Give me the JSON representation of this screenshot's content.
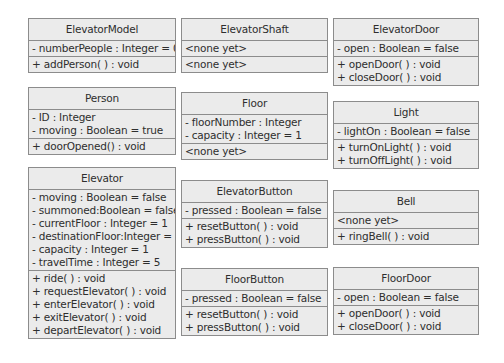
{
  "classes": {
    "elevatorModel": {
      "name": "ElevatorModel",
      "attributes": [
        "- numberPeople : Integer = 0"
      ],
      "operations": [
        "+ addPerson( ) : void"
      ]
    },
    "elevatorShaft": {
      "name": "ElevatorShaft",
      "attributes": [
        "<none yet>"
      ],
      "operations": [
        "<none yet>"
      ]
    },
    "elevatorDoor": {
      "name": "ElevatorDoor",
      "attributes": [
        "- open : Boolean = false"
      ],
      "operations": [
        "+ openDoor( ) : void",
        "+ closeDoor( ) : void"
      ]
    },
    "person": {
      "name": "Person",
      "attributes": [
        "- ID : Integer",
        "- moving : Boolean = true"
      ],
      "operations": [
        "+ doorOpened() : void"
      ]
    },
    "floor": {
      "name": "Floor",
      "attributes": [
        "- floorNumber : Integer",
        "- capacity : Integer = 1"
      ],
      "operations": [
        "<none yet>"
      ]
    },
    "light": {
      "name": "Light",
      "attributes": [
        "- lightOn : Boolean = false"
      ],
      "operations": [
        "+ turnOnLight( ) : void",
        "+ turnOffLight( ) : void"
      ]
    },
    "elevator": {
      "name": "Elevator",
      "attributes": [
        "- moving : Boolean = false",
        "- summoned:Boolean = false",
        "- currentFloor : Integer = 1",
        "- destinationFloor:Integer = 2",
        "- capacity : Integer = 1",
        "- travelTime : Integer = 5"
      ],
      "operations": [
        "+ ride( ) : void",
        "+ requestElevator( ) : void",
        "+ enterElevator( ) : void",
        "+ exitElevator( ) : void",
        "+ departElevator( ) : void"
      ]
    },
    "elevatorButton": {
      "name": "ElevatorButton",
      "attributes": [
        "- pressed : Boolean = false"
      ],
      "operations": [
        "+ resetButton( ) : void",
        "+ pressButton( ) : void"
      ]
    },
    "bell": {
      "name": "Bell",
      "attributes": [
        "<none yet>"
      ],
      "operations": [
        "+ ringBell( ) : void"
      ]
    },
    "floorButton": {
      "name": "FloorButton",
      "attributes": [
        "- pressed : Boolean = false"
      ],
      "operations": [
        "+ resetButton( ) : void",
        "+ pressButton( ) : void"
      ]
    },
    "floorDoor": {
      "name": "FloorDoor",
      "attributes": [
        "- open : Boolean = false"
      ],
      "operations": [
        "+ openDoor( ) : void",
        "+ closeDoor( ) : void"
      ]
    }
  }
}
